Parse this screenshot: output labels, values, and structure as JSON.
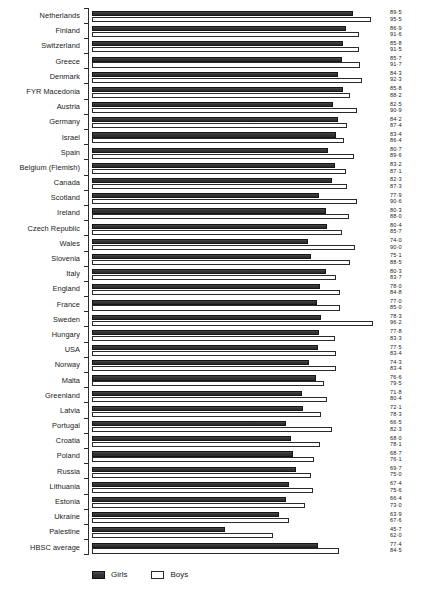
{
  "legend": {
    "girls_label": "Girls",
    "boys_label": "Boys",
    "position": "bottom-left"
  },
  "chart_data": {
    "type": "bar",
    "orientation": "horizontal",
    "title": "",
    "subtitle": "",
    "xlabel": "",
    "ylabel": "",
    "grid": false,
    "xlim": [
      0,
      100
    ],
    "legend_position": "bottom-left",
    "series": [
      {
        "name": "Girls",
        "color": "#3a3a3a",
        "values": [
          89.5,
          86.9,
          85.8,
          85.7,
          84.3,
          85.8,
          82.5,
          84.2,
          83.4,
          80.7,
          83.2,
          82.3,
          77.9,
          80.3,
          80.4,
          74.0,
          75.1,
          80.3,
          78.0,
          77.0,
          78.3,
          77.8,
          77.5,
          74.3,
          76.6,
          71.8,
          72.1,
          66.5,
          68.0,
          68.7,
          69.7,
          67.4,
          66.4,
          63.9,
          45.7,
          77.4
        ]
      },
      {
        "name": "Boys",
        "color": "#ffffff",
        "values": [
          95.5,
          91.6,
          91.5,
          91.7,
          92.3,
          88.2,
          90.9,
          87.4,
          86.4,
          89.6,
          87.1,
          87.3,
          90.6,
          88.0,
          85.7,
          90.0,
          88.5,
          83.7,
          84.8,
          85.0,
          96.2,
          83.3,
          83.4,
          83.4,
          79.5,
          80.4,
          78.3,
          82.3,
          78.1,
          76.1,
          75.0,
          75.6,
          73.0,
          67.6,
          62.0,
          84.5
        ]
      }
    ],
    "categories": [
      "Netherlands",
      "Finland",
      "Switzerland",
      "Greece",
      "Denmark",
      "FYR Macedonia",
      "Austria",
      "Germany",
      "Israel",
      "Spain",
      "Belgium (Flemish)",
      "Canada",
      "Scotland",
      "Ireland",
      "Czech Republic",
      "Wales",
      "Slovenia",
      "Italy",
      "England",
      "France",
      "Sweden",
      "Hungary",
      "USA",
      "Norway",
      "Malta",
      "Greenland",
      "Latvia",
      "Portugal",
      "Croatia",
      "Poland",
      "Russia",
      "Lithuania",
      "Estonia",
      "Ukraine",
      "Palestine",
      "HBSC average"
    ],
    "value_labels": [
      {
        "girls": "89·5",
        "boys": "95·5"
      },
      {
        "girls": "86·9",
        "boys": "91·6"
      },
      {
        "girls": "85·8",
        "boys": "91·5"
      },
      {
        "girls": "85·7",
        "boys": "91·7"
      },
      {
        "girls": "84·3",
        "boys": "92·3"
      },
      {
        "girls": "85·8",
        "boys": "88·2"
      },
      {
        "girls": "82·5",
        "boys": "90·9"
      },
      {
        "girls": "84·2",
        "boys": "87·4"
      },
      {
        "girls": "83·4",
        "boys": "86·4"
      },
      {
        "girls": "80·7",
        "boys": "89·6"
      },
      {
        "girls": "83·2",
        "boys": "87·1"
      },
      {
        "girls": "82·3",
        "boys": "87·3"
      },
      {
        "girls": "77·9",
        "boys": "90·6"
      },
      {
        "girls": "80·3",
        "boys": "88·0"
      },
      {
        "girls": "80·4",
        "boys": "85·7"
      },
      {
        "girls": "74·0",
        "boys": "90·0"
      },
      {
        "girls": "75·1",
        "boys": "88·5"
      },
      {
        "girls": "80·3",
        "boys": "83·7"
      },
      {
        "girls": "78·0",
        "boys": "84·8"
      },
      {
        "girls": "77·0",
        "boys": "85·0"
      },
      {
        "girls": "78·3",
        "boys": "96·2"
      },
      {
        "girls": "77·8",
        "boys": "83·3"
      },
      {
        "girls": "77·5",
        "boys": "83·4"
      },
      {
        "girls": "74·3",
        "boys": "83·4"
      },
      {
        "girls": "76·6",
        "boys": "79·5"
      },
      {
        "girls": "71·8",
        "boys": "80·4"
      },
      {
        "girls": "72·1",
        "boys": "78·3"
      },
      {
        "girls": "66·5",
        "boys": "82·3"
      },
      {
        "girls": "68·0",
        "boys": "78·1"
      },
      {
        "girls": "68·7",
        "boys": "76·1"
      },
      {
        "girls": "69·7",
        "boys": "75·0"
      },
      {
        "girls": "67·4",
        "boys": "75·6"
      },
      {
        "girls": "66·4",
        "boys": "73·0"
      },
      {
        "girls": "63·9",
        "boys": "67·6"
      },
      {
        "girls": "45·7",
        "boys": "62·0"
      },
      {
        "girls": "77·4",
        "boys": "84·5"
      }
    ]
  }
}
